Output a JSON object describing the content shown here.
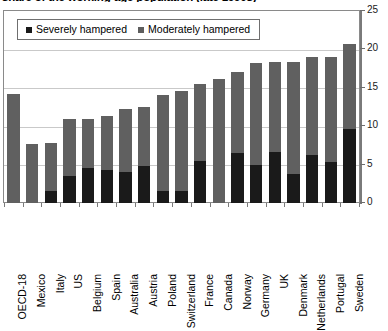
{
  "chart_data": {
    "type": "bar",
    "subtype": "stacked-column",
    "title": "share of the working-age population (late 1990s)",
    "xlabel": "",
    "ylabel": "",
    "ylim": [
      0,
      25
    ],
    "yticks": [
      0,
      5,
      10,
      15,
      20,
      25
    ],
    "grid": true,
    "legend_position": "top-left-inside",
    "categories": [
      "OECD-18",
      "Mexico",
      "Italy",
      "US",
      "Belgium",
      "Spain",
      "Australia",
      "Austria",
      "Poland",
      "Switzerland",
      "France",
      "Canada",
      "Norway",
      "Germany",
      "UK",
      "Denmark",
      "Netherlands",
      "Portugal",
      "Sweden"
    ],
    "series": [
      {
        "name": "Severely hampered",
        "color": "#1a1a1a",
        "values": [
          0.0,
          0.0,
          1.6,
          3.5,
          4.5,
          4.3,
          4.0,
          4.8,
          1.5,
          1.5,
          5.5,
          0.0,
          6.5,
          5.0,
          6.6,
          3.8,
          6.2,
          5.3,
          9.7
        ]
      },
      {
        "name": "Moderately hampered",
        "color": "#606060",
        "values": [
          14.2,
          7.7,
          6.2,
          7.4,
          6.5,
          7.0,
          8.2,
          7.7,
          12.5,
          13.1,
          10.0,
          16.1,
          10.5,
          13.2,
          11.7,
          14.6,
          12.8,
          13.7,
          11.0
        ]
      }
    ],
    "totals": [
      14.2,
      7.7,
      7.8,
      10.9,
      11.0,
      11.3,
      12.2,
      12.5,
      14.0,
      14.6,
      15.5,
      16.1,
      17.0,
      18.2,
      18.3,
      18.4,
      19.0,
      19.0,
      20.7
    ]
  },
  "legend": {
    "items": [
      {
        "label": "Severely hampered",
        "swatch": "severe"
      },
      {
        "label": "Moderately hampered",
        "swatch": "moderate"
      }
    ]
  }
}
